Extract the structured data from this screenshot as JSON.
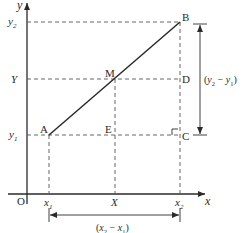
{
  "diagram": {
    "type": "coordinate-geometry",
    "axes": {
      "x_label": "x",
      "y_label": "y",
      "origin_label": "O"
    },
    "points": {
      "A": {
        "label": "A"
      },
      "B": {
        "label": "B"
      },
      "M": {
        "label": "M"
      },
      "C": {
        "label": "C"
      },
      "D": {
        "label": "D"
      },
      "E": {
        "label": "E"
      }
    },
    "x_ticks": {
      "x1": {
        "base": "x",
        "sub": "1"
      },
      "X": {
        "base": "X"
      },
      "x2": {
        "base": "x",
        "sub": "2"
      }
    },
    "y_ticks": {
      "y1": {
        "base": "y",
        "sub": "1"
      },
      "Y": {
        "base": "Y"
      },
      "y2": {
        "base": "y",
        "sub": "2"
      }
    },
    "dimensions": {
      "vertical": {
        "open": "(",
        "a": "y",
        "a_sub": "2",
        "minus": " − ",
        "b": "y",
        "b_sub": "1",
        "close": ")"
      },
      "horizontal": {
        "open": "(",
        "a": "x",
        "a_sub": "2",
        "minus": " − ",
        "b": "x",
        "b_sub": "1",
        "close": ")"
      }
    },
    "colors": {
      "line": "#2a2a2a",
      "dashed": "#555555"
    }
  }
}
